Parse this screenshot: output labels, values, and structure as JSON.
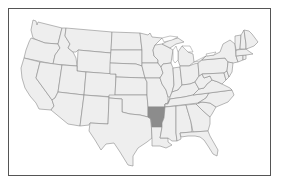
{
  "map": {
    "title": "United States map with Arkansas highlighted",
    "highlighted_state": "Arkansas",
    "colors": {
      "state_fill": "#eeeeee",
      "state_border": "#8a8a8a",
      "highlight_fill": "#8c8c8c",
      "frame_border": "#555555",
      "background": "#ffffff"
    },
    "states": [
      {
        "name": "Washington",
        "highlighted": false
      },
      {
        "name": "Oregon",
        "highlighted": false
      },
      {
        "name": "California",
        "highlighted": false
      },
      {
        "name": "Idaho",
        "highlighted": false
      },
      {
        "name": "Nevada",
        "highlighted": false
      },
      {
        "name": "Montana",
        "highlighted": false
      },
      {
        "name": "Wyoming",
        "highlighted": false
      },
      {
        "name": "Utah",
        "highlighted": false
      },
      {
        "name": "Arizona",
        "highlighted": false
      },
      {
        "name": "Colorado",
        "highlighted": false
      },
      {
        "name": "New Mexico",
        "highlighted": false
      },
      {
        "name": "North Dakota",
        "highlighted": false
      },
      {
        "name": "South Dakota",
        "highlighted": false
      },
      {
        "name": "Nebraska",
        "highlighted": false
      },
      {
        "name": "Kansas",
        "highlighted": false
      },
      {
        "name": "Oklahoma",
        "highlighted": false
      },
      {
        "name": "Texas",
        "highlighted": false
      },
      {
        "name": "Minnesota",
        "highlighted": false
      },
      {
        "name": "Iowa",
        "highlighted": false
      },
      {
        "name": "Missouri",
        "highlighted": false
      },
      {
        "name": "Arkansas",
        "highlighted": true
      },
      {
        "name": "Louisiana",
        "highlighted": false
      },
      {
        "name": "Wisconsin",
        "highlighted": false
      },
      {
        "name": "Illinois",
        "highlighted": false
      },
      {
        "name": "Michigan",
        "highlighted": false
      },
      {
        "name": "Indiana",
        "highlighted": false
      },
      {
        "name": "Ohio",
        "highlighted": false
      },
      {
        "name": "Kentucky",
        "highlighted": false
      },
      {
        "name": "Tennessee",
        "highlighted": false
      },
      {
        "name": "Mississippi",
        "highlighted": false
      },
      {
        "name": "Alabama",
        "highlighted": false
      },
      {
        "name": "Georgia",
        "highlighted": false
      },
      {
        "name": "Florida",
        "highlighted": false
      },
      {
        "name": "South Carolina",
        "highlighted": false
      },
      {
        "name": "North Carolina",
        "highlighted": false
      },
      {
        "name": "Virginia",
        "highlighted": false
      },
      {
        "name": "West Virginia",
        "highlighted": false
      },
      {
        "name": "Pennsylvania",
        "highlighted": false
      },
      {
        "name": "New York",
        "highlighted": false
      },
      {
        "name": "Maryland",
        "highlighted": false
      },
      {
        "name": "Delaware",
        "highlighted": false
      },
      {
        "name": "New Jersey",
        "highlighted": false
      },
      {
        "name": "Connecticut",
        "highlighted": false
      },
      {
        "name": "Rhode Island",
        "highlighted": false
      },
      {
        "name": "Massachusetts",
        "highlighted": false
      },
      {
        "name": "Vermont",
        "highlighted": false
      },
      {
        "name": "New Hampshire",
        "highlighted": false
      },
      {
        "name": "Maine",
        "highlighted": false
      }
    ]
  }
}
